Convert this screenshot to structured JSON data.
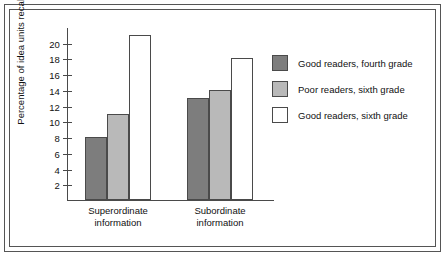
{
  "chart_data": {
    "type": "bar",
    "title": "",
    "subtitle": "",
    "xlabel": "",
    "ylabel": "Percentage of idea units recalled",
    "categories": [
      "Superordinate information",
      "Subordinate information"
    ],
    "category_lines": [
      [
        "Superordinate",
        "information"
      ],
      [
        "Subordinate",
        "information"
      ]
    ],
    "series": [
      {
        "name": "Good readers, fourth grade",
        "values": [
          8,
          13
        ],
        "color": "#7d7d7d"
      },
      {
        "name": "Poor readers, sixth grade",
        "values": [
          11,
          14
        ],
        "color": "#b9b9b9"
      },
      {
        "name": "Good readers, sixth grade",
        "values": [
          21,
          18
        ],
        "color": "#ffffff"
      }
    ],
    "ylim": [
      0,
      22
    ],
    "yticks": [
      2,
      4,
      6,
      8,
      10,
      12,
      14,
      16,
      18,
      20
    ],
    "ytick_labels": [
      "2",
      "4",
      "6",
      "8",
      "10",
      "12",
      "14",
      "16",
      "18",
      "20"
    ],
    "grid": false,
    "legend_position": "right"
  },
  "legend": {
    "entries": [
      "Good readers, fourth grade",
      "Poor readers, sixth grade",
      "Good readers, sixth grade"
    ]
  },
  "axes": {
    "y_title": "Percentage of idea units recalled"
  }
}
